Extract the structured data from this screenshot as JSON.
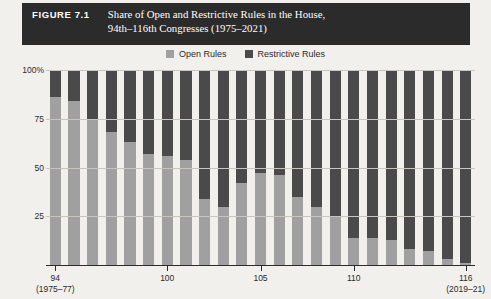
{
  "figure": {
    "label": "FIGURE 7.1",
    "title_line1": "Share of Open and Restrictive Rules in the House,",
    "title_line2": "94th–116th Congresses (1975–2021)"
  },
  "legend": {
    "items": [
      {
        "label": "Open Rules",
        "color": "#a0a0a0"
      },
      {
        "label": "Restrictive Rules",
        "color": "#4a4a4a"
      }
    ]
  },
  "colors": {
    "open": "#a0a0a0",
    "restrictive": "#4a4a4a",
    "banner": "#2b2b2b",
    "page": "#f2f0ec",
    "grid": "#c9c6c0"
  },
  "chart_data": {
    "type": "bar",
    "title": "Share of Open and Restrictive Rules in the House, 94th–116th Congresses (1975–2021)",
    "stacked": true,
    "xlabel": "",
    "ylabel": "",
    "ylim": [
      0,
      100
    ],
    "ytick_labels": [
      "100%",
      "75",
      "50",
      "25"
    ],
    "ytick_values": [
      100,
      75,
      50,
      25
    ],
    "grid": true,
    "legend_position": "top-center",
    "categories": [
      94,
      95,
      96,
      97,
      98,
      99,
      100,
      101,
      102,
      103,
      104,
      105,
      106,
      107,
      108,
      109,
      110,
      111,
      112,
      113,
      114,
      115,
      116
    ],
    "xtick_labels": [
      {
        "congress": 94,
        "label": "94",
        "sub": "(1975–77)"
      },
      {
        "congress": 100,
        "label": "100",
        "sub": ""
      },
      {
        "congress": 105,
        "label": "105",
        "sub": ""
      },
      {
        "congress": 110,
        "label": "110",
        "sub": ""
      },
      {
        "congress": 116,
        "label": "116",
        "sub": "(2019–21)"
      }
    ],
    "series": [
      {
        "name": "Open Rules",
        "color": "#a0a0a0",
        "values": [
          86,
          84,
          75,
          68,
          63,
          57,
          56,
          54,
          34,
          30,
          42,
          47,
          46,
          35,
          30,
          25,
          14,
          14,
          13,
          8,
          7,
          3,
          1
        ]
      },
      {
        "name": "Restrictive Rules",
        "color": "#4a4a4a",
        "values": [
          14,
          16,
          25,
          32,
          37,
          43,
          44,
          46,
          66,
          70,
          58,
          53,
          54,
          65,
          70,
          75,
          86,
          86,
          87,
          92,
          93,
          97,
          99
        ]
      }
    ]
  }
}
